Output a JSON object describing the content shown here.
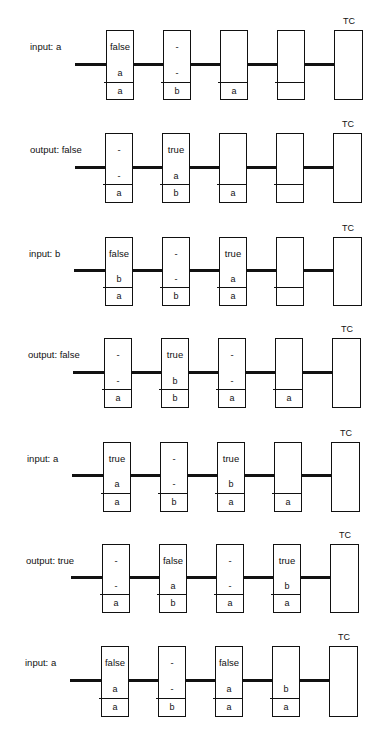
{
  "header": {
    "cut_off_text": ""
  },
  "terminal_label": "TC",
  "panels": [
    {
      "label": "input: a",
      "geom": {
        "top": 30,
        "line": 64,
        "div": 82,
        "bottom": 99,
        "wire_x": 75,
        "x0": 106
      },
      "cells": [
        {
          "state": "false",
          "mid": "a",
          "bot": "a"
        },
        {
          "state": "-",
          "mid": "-",
          "bot": "b"
        },
        {
          "state": "",
          "mid": "",
          "bot": "a"
        },
        {
          "state": "",
          "mid": "",
          "bot": ""
        }
      ]
    },
    {
      "label": "output: false",
      "geom": {
        "top": 133,
        "line": 167,
        "div": 184,
        "bottom": 202,
        "wire_x": 75,
        "x0": 105
      },
      "cells": [
        {
          "state": "-",
          "mid": "-",
          "bot": "a"
        },
        {
          "state": "true",
          "mid": "a",
          "bot": "b"
        },
        {
          "state": "",
          "mid": "",
          "bot": "a"
        },
        {
          "state": "",
          "mid": "",
          "bot": ""
        }
      ]
    },
    {
      "label": "input: b",
      "geom": {
        "top": 237,
        "line": 270,
        "div": 287,
        "bottom": 305,
        "wire_x": 74,
        "x0": 105
      },
      "cells": [
        {
          "state": "false",
          "mid": "b",
          "bot": "a"
        },
        {
          "state": "-",
          "mid": "-",
          "bot": "b"
        },
        {
          "state": "true",
          "mid": "a",
          "bot": "a"
        },
        {
          "state": "",
          "mid": "",
          "bot": ""
        }
      ]
    },
    {
      "label": "output:  false",
      "geom": {
        "top": 338,
        "line": 372,
        "div": 389,
        "bottom": 407,
        "wire_x": 73,
        "x0": 104
      },
      "cells": [
        {
          "state": "-",
          "mid": "-",
          "bot": "a"
        },
        {
          "state": "true",
          "mid": "b",
          "bot": "b"
        },
        {
          "state": "-",
          "mid": "-",
          "bot": "a"
        },
        {
          "state": "",
          "mid": "",
          "bot": "a"
        }
      ]
    },
    {
      "label": "input: a",
      "geom": {
        "top": 442,
        "line": 475,
        "div": 493,
        "bottom": 511,
        "wire_x": 72,
        "x0": 103
      },
      "cells": [
        {
          "state": "true",
          "mid": "a",
          "bot": "a"
        },
        {
          "state": "-",
          "mid": "-",
          "bot": "b"
        },
        {
          "state": "true",
          "mid": "b",
          "bot": "a"
        },
        {
          "state": "",
          "mid": "",
          "bot": "a"
        }
      ]
    },
    {
      "label": "output:  true",
      "geom": {
        "top": 544,
        "line": 577,
        "div": 594,
        "bottom": 612,
        "wire_x": 71,
        "x0": 102
      },
      "cells": [
        {
          "state": "-",
          "mid": "-",
          "bot": "a"
        },
        {
          "state": "false",
          "mid": "a",
          "bot": "b"
        },
        {
          "state": "-",
          "mid": "-",
          "bot": "a"
        },
        {
          "state": "true",
          "mid": "b",
          "bot": "a"
        }
      ]
    },
    {
      "label": "input: a",
      "geom": {
        "top": 646,
        "line": 680,
        "div": 698,
        "bottom": 716,
        "wire_x": 70,
        "x0": 101
      },
      "cells": [
        {
          "state": "false",
          "mid": "a",
          "bot": "a"
        },
        {
          "state": "-",
          "mid": "-",
          "bot": "b"
        },
        {
          "state": "false",
          "mid": "a",
          "bot": "a"
        },
        {
          "state": "",
          "mid": "b",
          "bot": "a"
        }
      ]
    }
  ]
}
